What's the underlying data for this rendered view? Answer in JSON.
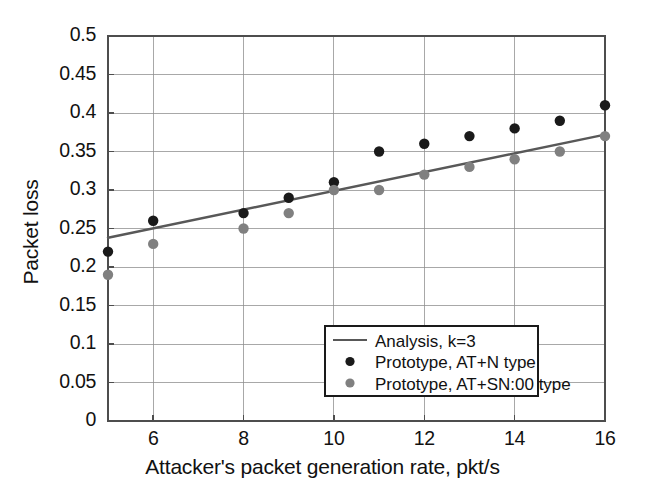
{
  "figure": {
    "background": "#ffffff",
    "plot_area": {
      "left": 108,
      "top": 36,
      "right": 605,
      "bottom": 421
    },
    "grid_color": "#8c8c8c",
    "axis_color": "#4d4d4d"
  },
  "chart_data": {
    "type": "scatter",
    "title": "",
    "xlabel": "Attacker's packet generation rate, pkt/s",
    "ylabel": "Packet loss",
    "xlim": [
      5,
      16
    ],
    "ylim": [
      0,
      0.5
    ],
    "xticks": [
      6,
      8,
      10,
      12,
      14,
      16
    ],
    "xticklabels": [
      "6",
      "8",
      "10",
      "12",
      "14",
      "16"
    ],
    "yticks": [
      0,
      0.05,
      0.1,
      0.15,
      0.2,
      0.25,
      0.3,
      0.35,
      0.4,
      0.45,
      0.5
    ],
    "yticklabels": [
      "0",
      "0.05",
      "0.1",
      "0.15",
      "0.2",
      "0.25",
      "0.3",
      "0.35",
      "0.4",
      "0.45",
      "0.5"
    ],
    "grid": true,
    "legend_position": "lower-center-right",
    "series": [
      {
        "name": "Analysis, k=3",
        "marker": "line",
        "color": "#585858",
        "x": [
          5,
          16
        ],
        "values": [
          0.238,
          0.372
        ]
      },
      {
        "name": "Prototype, AT+N type",
        "marker": "circle",
        "color": "#1a1a1a",
        "x": [
          5,
          6,
          8,
          9,
          10,
          11,
          12,
          13,
          14,
          15,
          16
        ],
        "values": [
          0.22,
          0.26,
          0.27,
          0.29,
          0.31,
          0.35,
          0.36,
          0.37,
          0.38,
          0.39,
          0.41
        ]
      },
      {
        "name": "Prototype, AT+SN:00 type",
        "marker": "circle",
        "color": "#808080",
        "x": [
          5,
          6,
          8,
          9,
          10,
          11,
          12,
          13,
          14,
          15,
          16
        ],
        "values": [
          0.19,
          0.23,
          0.25,
          0.27,
          0.3,
          0.3,
          0.32,
          0.33,
          0.34,
          0.35,
          0.37
        ]
      }
    ]
  },
  "legend": {
    "box": {
      "x": 325,
      "y": 326,
      "width": 213,
      "height": 70
    },
    "entries": [
      {
        "label": "Analysis, k=3",
        "swatch": "line",
        "color": "#585858"
      },
      {
        "label": "Prototype, AT+N type",
        "swatch": "circle",
        "color": "#1a1a1a"
      },
      {
        "label": "Prototype, AT+SN:00 type",
        "swatch": "circle",
        "color": "#808080"
      }
    ]
  }
}
